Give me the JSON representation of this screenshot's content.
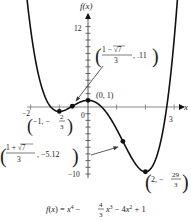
{
  "chart_data": {
    "type": "line",
    "title": "",
    "function_label": "f(x) = x⁴ − (4/3)x³ − 4x² + 1",
    "xlabel": "x",
    "ylabel": "f(x)",
    "xlim": [
      -2.3,
      3.3
    ],
    "ylim": [
      -11,
      13
    ],
    "x_ticks": [
      -2,
      -1,
      0,
      1,
      2,
      3
    ],
    "x_tick_labels": [
      "−2",
      "0",
      "3"
    ],
    "y_tick_labels": [
      "12",
      "−10"
    ],
    "grid": false,
    "series": [
      {
        "name": "f(x)",
        "coefficients": [
          1,
          -1.3333,
          -4,
          0,
          1
        ],
        "x": [
          -2.2,
          -2,
          -1.5,
          -1,
          -0.5,
          -0.55,
          0,
          0.5,
          1,
          1.5,
          2,
          2.5,
          3,
          3.3
        ],
        "y": [
          8.94,
          5.67,
          0.06,
          -0.67,
          0.23,
          0.11,
          1,
          -0.11,
          -3.33,
          -6.44,
          -9.67,
          -6.35,
          10,
          15.67
        ]
      }
    ],
    "annotations": [
      {
        "label": "(0, 1)",
        "x": 0,
        "y": 1
      },
      {
        "label": "(−1, −2/3)",
        "x": -1,
        "y": -0.667
      },
      {
        "label": "((1−√7)/3, .11)",
        "x": -0.549,
        "y": 0.11
      },
      {
        "label": "((1+√7)/3, −5.12)",
        "x": 1.215,
        "y": -5.12
      },
      {
        "label": "(2, −29/3)",
        "x": 2,
        "y": -9.667
      }
    ]
  },
  "labels": {
    "y_axis": "f(x)",
    "x_axis": "x",
    "tick_12": "12",
    "tick_m10": "−10",
    "tick_m2": "−2",
    "tick_0": "0",
    "tick_3": "3",
    "pt_0_1": "(0, 1)",
    "eq_prefix": "f(x) = x",
    "eq_p4": "4",
    "eq_mid1": " − ",
    "eq_frac_num": "4",
    "eq_frac_den": "3",
    "eq_x3": "x",
    "eq_p3": "3",
    "eq_mid2": " − 4x",
    "eq_p2": "2",
    "eq_end": " + 1"
  }
}
